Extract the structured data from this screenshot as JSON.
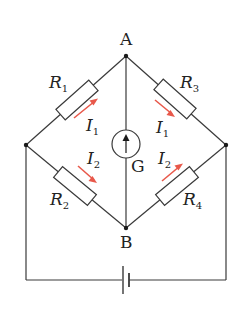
{
  "diagram": {
    "type": "wheatstone-bridge-circuit",
    "nodes": {
      "top": {
        "label": "A"
      },
      "bottom": {
        "label": "B"
      }
    },
    "resistors": [
      {
        "id": "R1",
        "symbol": "R",
        "subscript": "1",
        "branch": "left-node to A"
      },
      {
        "id": "R2",
        "symbol": "R",
        "subscript": "2",
        "branch": "left-node to B"
      },
      {
        "id": "R3",
        "symbol": "R",
        "subscript": "3",
        "branch": "A to right-node"
      },
      {
        "id": "R4",
        "symbol": "R",
        "subscript": "4",
        "branch": "B to right-node"
      }
    ],
    "currents": [
      {
        "symbol": "I",
        "subscript": "1",
        "through": "R1",
        "direction": "toward A"
      },
      {
        "symbol": "I",
        "subscript": "1",
        "through": "R3",
        "direction": "away from A"
      },
      {
        "symbol": "I",
        "subscript": "2",
        "through": "R2",
        "direction": "toward B"
      },
      {
        "symbol": "I",
        "subscript": "2",
        "through": "R4",
        "direction": "away from B"
      }
    ],
    "galvanometer": {
      "label": "G",
      "arrow": "up"
    },
    "battery": {
      "label": ""
    },
    "colors": {
      "wire": "#3a3a3a",
      "current_arrow": "#e8584a",
      "background": "#ffffff"
    }
  }
}
